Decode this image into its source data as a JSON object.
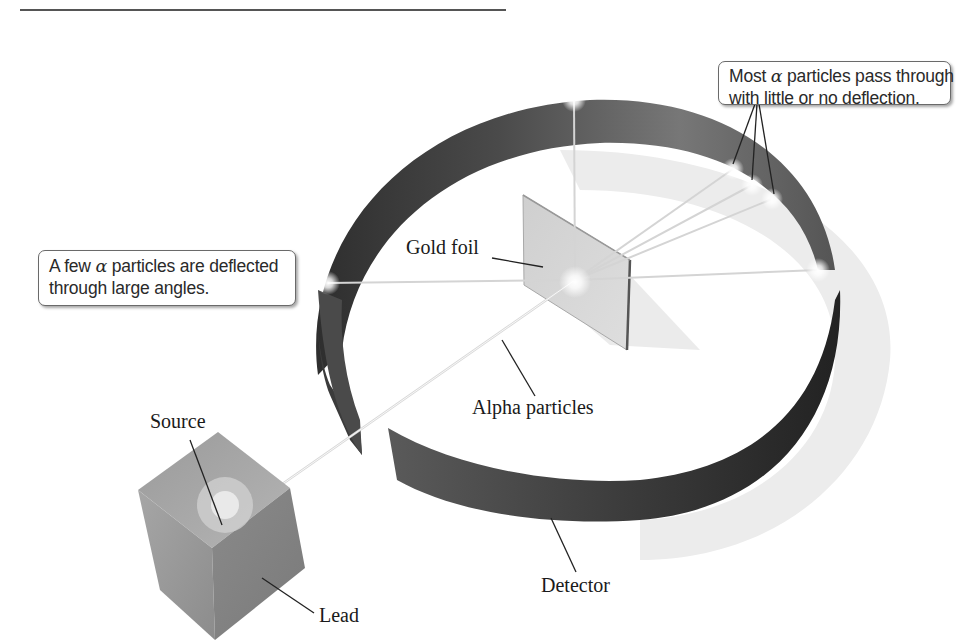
{
  "figure": {
    "callouts": {
      "most_particles": {
        "line1_prefix": "Most ",
        "alpha": "α",
        "line1_suffix": " particles pass through",
        "line2": "with little or no deflection."
      },
      "few_particles": {
        "line1_prefix": "A few ",
        "alpha": "α",
        "line1_suffix": " particles are deflected",
        "line2": "through large angles."
      }
    },
    "labels": {
      "gold_foil": "Gold foil",
      "alpha_particles": "Alpha particles",
      "source": "Source",
      "lead": "Lead",
      "detector": "Detector"
    },
    "colors": {
      "detector_dark": "#3a3a3a",
      "detector_mid": "#6e6e6e",
      "foil": "#c9c9c9",
      "lead_block": "#8f8f8f",
      "shadow": "#ececec",
      "beam": "#f2f2f2",
      "leader_line": "#222222"
    }
  }
}
